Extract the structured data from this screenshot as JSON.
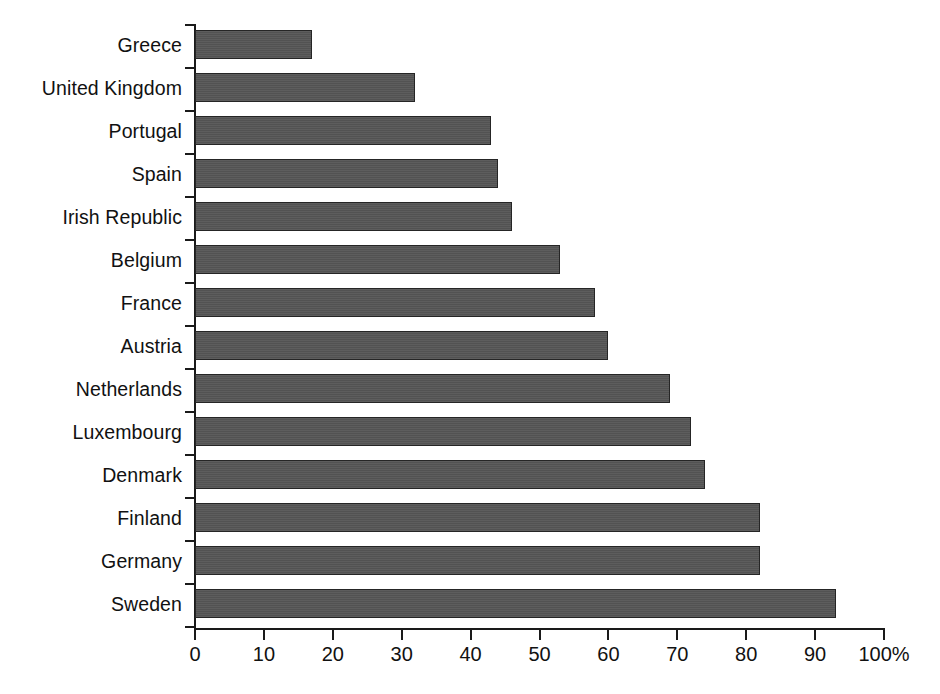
{
  "chart_data": {
    "type": "bar",
    "orientation": "horizontal",
    "title": "",
    "xlabel": "",
    "ylabel": "",
    "xlim": [
      0,
      100
    ],
    "grid": false,
    "legend": null,
    "unit": "%",
    "categories": [
      "Greece",
      "United Kingdom",
      "Portugal",
      "Spain",
      "Irish Republic",
      "Belgium",
      "France",
      "Austria",
      "Netherlands",
      "Luxembourg",
      "Denmark",
      "Finland",
      "Germany",
      "Sweden"
    ],
    "values": [
      17,
      32,
      43,
      44,
      46,
      53,
      58,
      60,
      69,
      72,
      74,
      82,
      82,
      93
    ],
    "xticks": [
      0,
      10,
      20,
      30,
      40,
      50,
      60,
      70,
      80,
      90,
      100
    ],
    "xticklabels": [
      "0",
      "10",
      "20",
      "30",
      "40",
      "50",
      "60",
      "70",
      "80",
      "90",
      "100%"
    ],
    "bar_color": "#565656",
    "bar_edge_color": "#252525",
    "axis_color": "#1a1a1a",
    "background": "#ffffff"
  },
  "caption": {
    "text": ""
  }
}
